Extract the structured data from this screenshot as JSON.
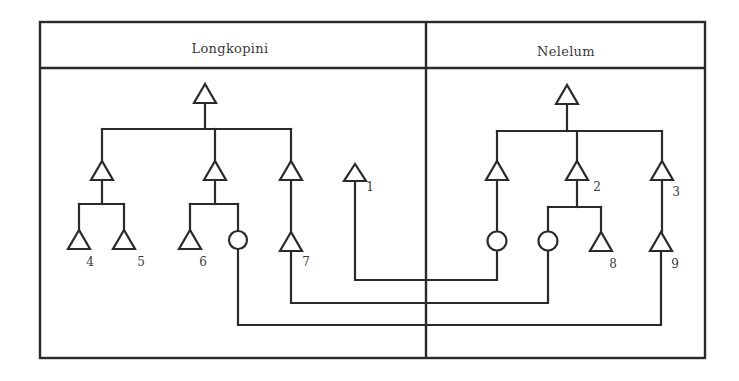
{
  "diagram": {
    "type": "kinship-diagram",
    "panels": [
      {
        "id": "left",
        "title": "Longkopini"
      },
      {
        "id": "right",
        "title": "Nelelum"
      }
    ],
    "legend": {
      "triangle": "male",
      "circle": "female"
    },
    "labels": {
      "n1": "1",
      "n2": "2",
      "n3": "3",
      "n4": "4",
      "n5": "5",
      "n6": "6",
      "n7": "7",
      "n8": "8",
      "n9": "9"
    },
    "nodes": [
      {
        "id": "L-root",
        "panel": "Longkopini",
        "shape": "triangle",
        "label": ""
      },
      {
        "id": "L-a",
        "panel": "Longkopini",
        "shape": "triangle",
        "label": "",
        "parent": "L-root"
      },
      {
        "id": "L-b",
        "panel": "Longkopini",
        "shape": "triangle",
        "label": "",
        "parent": "L-root"
      },
      {
        "id": "L-c",
        "panel": "Longkopini",
        "shape": "triangle",
        "label": "",
        "parent": "L-root"
      },
      {
        "id": "4",
        "panel": "Longkopini",
        "shape": "triangle",
        "label": "4",
        "parent": "L-a"
      },
      {
        "id": "5",
        "panel": "Longkopini",
        "shape": "triangle",
        "label": "5",
        "parent": "L-a"
      },
      {
        "id": "6",
        "panel": "Longkopini",
        "shape": "triangle",
        "label": "6",
        "parent": "L-b"
      },
      {
        "id": "L-f",
        "panel": "Longkopini",
        "shape": "circle",
        "label": "",
        "parent": "L-b"
      },
      {
        "id": "7",
        "panel": "Longkopini",
        "shape": "triangle",
        "label": "7",
        "parent": "L-c"
      },
      {
        "id": "1",
        "panel": "Longkopini",
        "shape": "triangle",
        "label": "1"
      },
      {
        "id": "R-root",
        "panel": "Nelelum",
        "shape": "triangle",
        "label": ""
      },
      {
        "id": "R-a",
        "panel": "Nelelum",
        "shape": "triangle",
        "label": "",
        "parent": "R-root"
      },
      {
        "id": "2",
        "panel": "Nelelum",
        "shape": "triangle",
        "label": "2",
        "parent": "R-root"
      },
      {
        "id": "3",
        "panel": "Nelelum",
        "shape": "triangle",
        "label": "3",
        "parent": "R-root"
      },
      {
        "id": "R-f1",
        "panel": "Nelelum",
        "shape": "circle",
        "label": "",
        "parent": "R-a"
      },
      {
        "id": "R-f2",
        "panel": "Nelelum",
        "shape": "circle",
        "label": "",
        "parent": "2"
      },
      {
        "id": "8",
        "panel": "Nelelum",
        "shape": "triangle",
        "label": "8",
        "parent": "2"
      },
      {
        "id": "9",
        "panel": "Nelelum",
        "shape": "triangle",
        "label": "9",
        "parent": "3"
      }
    ],
    "marriages": [
      {
        "husband": "1",
        "wife": "R-f1"
      },
      {
        "husband": "7",
        "wife": "R-f2"
      },
      {
        "husband": "9",
        "wife": "L-f"
      }
    ]
  }
}
